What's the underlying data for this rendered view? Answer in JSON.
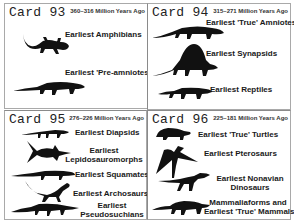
{
  "cards": [
    {
      "title": "Card 93",
      "date_range": "360–316 Million Years Ago",
      "items": [
        {
          "label": "Earliest Amphibians",
          "icon": "salamander-silhouette-icon"
        },
        {
          "label": "Earliest 'Pre-amniotes'",
          "icon": "lizard-silhouette-icon"
        }
      ]
    },
    {
      "title": "Card 94",
      "date_range": "315–271 Million Years Ago",
      "items": [
        {
          "label": "Earliest 'True' Amniotes",
          "icon": "amniote-silhouette-icon"
        },
        {
          "label": "Earliest Synapsids",
          "icon": "dimetrodon-silhouette-icon"
        },
        {
          "label": "Earliest Reptiles",
          "icon": "reptile-silhouette-icon"
        }
      ]
    },
    {
      "title": "Card 95",
      "date_range": "276–226 Million Years Ago",
      "items": [
        {
          "label": "Earliest Diapsids",
          "icon": "diapsid-silhouette-icon"
        },
        {
          "label_line1": "Earliest",
          "label_line2": "Lepidosauromorphs",
          "icon": "ichthyosaur-silhouette-icon"
        },
        {
          "label": "Earliest Squamates",
          "icon": "squamate-silhouette-icon"
        },
        {
          "label": "Earliest Archosaurs",
          "icon": "archosaur-silhouette-icon"
        },
        {
          "label_line1": "Earliest",
          "label_line2": "Pseudosuchians",
          "icon": "crocodile-silhouette-icon"
        }
      ]
    },
    {
      "title": "Card 96",
      "date_range": "225–181 Million Years Ago",
      "items": [
        {
          "label": "Earliest 'True' Turtles",
          "icon": "turtle-silhouette-icon"
        },
        {
          "label": "Earliest Pterosaurs",
          "icon": "pterosaur-silhouette-icon"
        },
        {
          "label_line1": "Earliest Nonavian",
          "label_line2": "Dinosaurs",
          "icon": "dinosaur-silhouette-icon"
        },
        {
          "label_line1": "Mammaliaforms and",
          "label_line2": "Earliest 'True' Mammals",
          "icon": "mammal-silhouette-icon"
        }
      ]
    }
  ]
}
